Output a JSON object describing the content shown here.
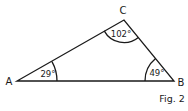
{
  "figure": {
    "caption": "Fig. 2",
    "vertices": [
      {
        "name": "A",
        "angle": "29°"
      },
      {
        "name": "B",
        "angle": "49°"
      },
      {
        "name": "C",
        "angle": "102°"
      }
    ]
  }
}
